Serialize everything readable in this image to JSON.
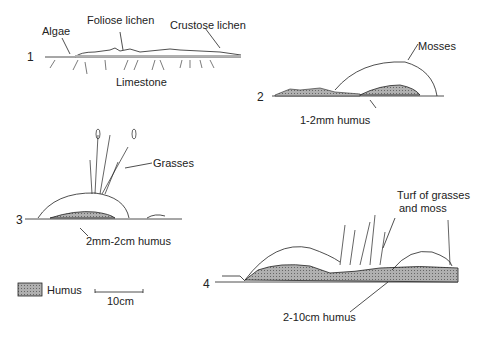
{
  "stages": [
    {
      "number": "1",
      "labels": {
        "algae": "Algae",
        "foliose": "Foliose lichen",
        "crustose": "Crustose lichen",
        "substrate": "Limestone"
      }
    },
    {
      "number": "2",
      "labels": {
        "mosses": "Mosses",
        "humus": "1-2mm humus"
      }
    },
    {
      "number": "3",
      "labels": {
        "grasses": "Grasses",
        "humus": "2mm-2cm humus"
      }
    },
    {
      "number": "4",
      "labels": {
        "turf_line1": "Turf of grasses",
        "turf_line2": "and moss",
        "humus": "2-10cm humus"
      }
    }
  ],
  "legend": {
    "humus_label": "Humus",
    "humus_color": "#9a9a9a"
  },
  "scale": {
    "label": "10cm"
  }
}
